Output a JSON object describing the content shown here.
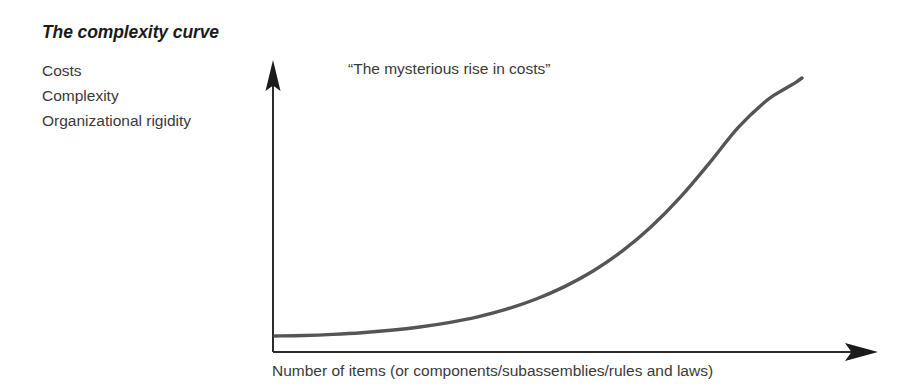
{
  "figure": {
    "title": "The complexity curve",
    "background_color": "#ffffff",
    "ink_color": "#2b2b2b"
  },
  "y_axis": {
    "labels": [
      "Costs",
      "Complexity",
      "Organizational rigidity"
    ],
    "arrow": "arrow-up-icon"
  },
  "x_axis": {
    "caption": "Number of items (or components/subassemblies/rules and laws)",
    "arrow": "arrow-right-icon"
  },
  "annotations": {
    "callout": "“The mysterious rise in costs”"
  },
  "chart_data": {
    "type": "line",
    "title": "The complexity curve",
    "xlabel": "Number of items (or components/subassemblies/rules and laws)",
    "ylabel": "Costs / Complexity / Organizational rigidity",
    "grid": false,
    "legend": null,
    "axis_arrows": true,
    "tick_labels": {
      "x": [],
      "y": []
    },
    "xlim": [
      0,
      100
    ],
    "ylim": [
      0,
      100
    ],
    "annotations": [
      {
        "text": "“The mysterious rise in costs”",
        "x": 13,
        "y": 96
      }
    ],
    "series": [
      {
        "name": "complexity curve",
        "description": "exponential rise of cost/complexity with number of items",
        "x": [
          0,
          5,
          10,
          15,
          20,
          25,
          30,
          35,
          40,
          45,
          50,
          55,
          60,
          65,
          70,
          75,
          80,
          85,
          88,
          90,
          91
        ],
        "y": [
          3,
          3.2,
          3.6,
          4.2,
          5.1,
          6.3,
          7.9,
          10.0,
          12.8,
          16.4,
          21.0,
          26.8,
          34.0,
          42.9,
          53.6,
          66.0,
          79.0,
          89.0,
          93.0,
          95.5,
          97.0
        ]
      }
    ]
  }
}
